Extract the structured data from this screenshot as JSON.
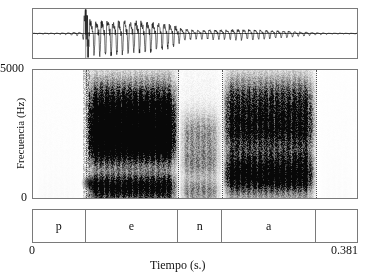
{
  "figure": {
    "title": "",
    "type": "speech-waveform-and-spectrogram"
  },
  "axes": {
    "y_label": "Frecuencia (Hz)",
    "y_tick_max": "5000",
    "y_tick_min": "0",
    "x_label": "Tiempo (s.)",
    "x_tick_min": "0",
    "x_tick_max": "0.381"
  },
  "segmentation": {
    "cells": [
      {
        "label": "p",
        "start": 0.0,
        "end": 0.062
      },
      {
        "label": "e",
        "start": 0.062,
        "end": 0.171
      },
      {
        "label": "n",
        "start": 0.171,
        "end": 0.222
      },
      {
        "label": "a",
        "start": 0.222,
        "end": 0.333
      },
      {
        "label": "",
        "start": 0.333,
        "end": 0.381
      }
    ]
  },
  "colors": {
    "frame": "#7a7a7a",
    "trace": "#111111",
    "divider": "#555555",
    "background": "#ffffff"
  },
  "chart_data": {
    "type": "line",
    "title": "",
    "xlabel": "Tiempo (s.)",
    "ylabel": "Frecuencia (Hz)",
    "xlim": [
      0,
      0.381
    ],
    "ylim": [
      0,
      5000
    ],
    "grid": false,
    "legend": "none",
    "panels": [
      {
        "name": "waveform",
        "type": "line",
        "xlabel": "",
        "ylabel": "Amplitud",
        "xlim": [
          0,
          0.381
        ],
        "ylim": [
          -1,
          1
        ],
        "annotations": [
          {
            "type": "vline",
            "x": 0.062,
            "note": "burst onset / p-e boundary"
          }
        ],
        "envelope_x": [
          0.0,
          0.04,
          0.052,
          0.058,
          0.062,
          0.07,
          0.09,
          0.11,
          0.13,
          0.15,
          0.165,
          0.175,
          0.185,
          0.2,
          0.222,
          0.24,
          0.26,
          0.28,
          0.3,
          0.32,
          0.333,
          0.35,
          0.381
        ],
        "envelope_y": [
          0.02,
          0.05,
          0.1,
          0.06,
          0.95,
          0.88,
          0.92,
          0.86,
          0.8,
          0.7,
          0.55,
          0.34,
          0.26,
          0.24,
          0.26,
          0.28,
          0.26,
          0.22,
          0.16,
          0.1,
          0.06,
          0.03,
          0.02
        ],
        "f0_hz": 150
      },
      {
        "name": "spectrogram",
        "type": "heatmap",
        "xlabel": "Tiempo (s.)",
        "ylabel": "Frecuencia (Hz)",
        "xlim": [
          0,
          0.381
        ],
        "ylim": [
          0,
          5000
        ],
        "colormap": "grayscale-inverted",
        "segments": [
          {
            "label": "p",
            "start": 0.0,
            "end": 0.062,
            "energy": 0.05,
            "formants_hz": []
          },
          {
            "label": "e",
            "start": 0.062,
            "end": 0.171,
            "energy": 0.95,
            "formants_hz": [
              450,
              2000,
              2700,
              3600
            ]
          },
          {
            "label": "n",
            "start": 0.171,
            "end": 0.222,
            "energy": 0.35,
            "formants_hz": [
              300,
              1400,
              2500
            ]
          },
          {
            "label": "a",
            "start": 0.222,
            "end": 0.333,
            "energy": 0.75,
            "formants_hz": [
              700,
              1300,
              2600,
              3700
            ]
          },
          {
            "label": "",
            "start": 0.333,
            "end": 0.381,
            "energy": 0.04,
            "formants_hz": []
          }
        ],
        "annotations": [
          {
            "type": "vline",
            "x": 0.062
          },
          {
            "type": "vline",
            "x": 0.171
          },
          {
            "type": "vline",
            "x": 0.222
          },
          {
            "type": "vline",
            "x": 0.333
          }
        ]
      }
    ]
  }
}
